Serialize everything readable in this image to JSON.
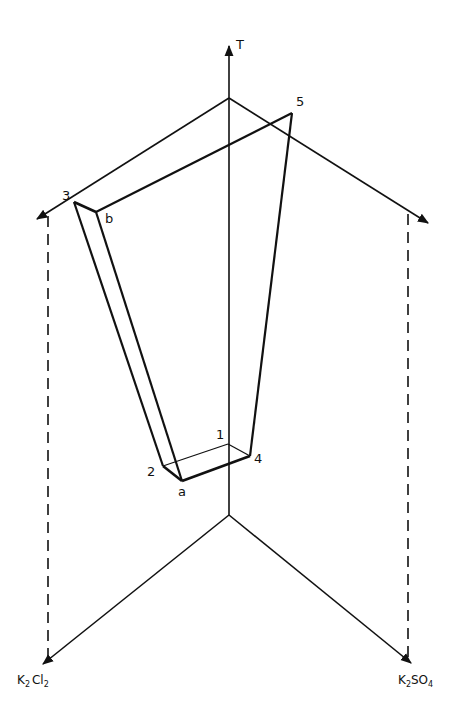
{
  "diagram": {
    "type": "ternary-prism phase diagram",
    "axis_vertical_label": "T",
    "component_left": {
      "base": "K",
      "sub1": "2",
      "mid": "Cl",
      "sub2": "2"
    },
    "component_right": {
      "base": "K",
      "sub1": "2",
      "mid": "SO",
      "sub2": "4"
    },
    "points": {
      "p1": "1",
      "p2": "2",
      "p3": "3",
      "p4": "4",
      "p5": "5",
      "pa": "a",
      "pb": "b"
    },
    "colors": {
      "ink": "#111111",
      "background": "#ffffff"
    }
  }
}
